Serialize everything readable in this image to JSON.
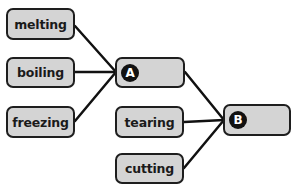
{
  "diagram": {
    "groups": [
      {
        "id": "A",
        "label": "A",
        "sources": [
          {
            "label": "melting"
          },
          {
            "label": "boiling"
          },
          {
            "label": "freezing"
          }
        ]
      },
      {
        "id": "B",
        "label": "B",
        "sources": [
          {
            "label": "tearing"
          },
          {
            "label": "cutting"
          }
        ]
      }
    ],
    "colors": {
      "box_fill": "#d4d4d4",
      "box_border": "#1e1e1e",
      "badge_fill": "#111111",
      "line": "#111111"
    }
  }
}
